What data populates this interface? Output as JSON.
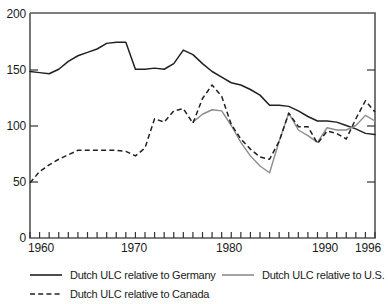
{
  "chart_data": {
    "type": "line",
    "title": "",
    "subtitle": "",
    "xlabel": "",
    "ylabel": "",
    "xlim": [
      1960,
      1996
    ],
    "ylim": [
      0,
      200
    ],
    "grid": false,
    "legend_position": "bottom",
    "y_ticks": [
      0,
      50,
      100,
      150,
      200
    ],
    "y_tick_labels": [
      "0",
      "50",
      "100",
      "150",
      "200"
    ],
    "x_ticks": [
      1960,
      1961,
      1962,
      1963,
      1964,
      1965,
      1966,
      1967,
      1968,
      1969,
      1970,
      1971,
      1972,
      1973,
      1974,
      1975,
      1976,
      1977,
      1978,
      1979,
      1980,
      1981,
      1982,
      1983,
      1984,
      1985,
      1986,
      1987,
      1988,
      1989,
      1990,
      1991,
      1992,
      1993,
      1994,
      1995,
      1996
    ],
    "x_tick_labels": [
      "1960",
      "1970",
      "1980",
      "1990",
      "1996"
    ],
    "x_labeled_ticks": [
      1960,
      1970,
      1980,
      1990,
      1996
    ],
    "series": [
      {
        "name": "Dutch ULC relative to Germany",
        "style": "solid",
        "color": "#231f20",
        "x": [
          1960,
          1961,
          1962,
          1963,
          1964,
          1965,
          1966,
          1967,
          1968,
          1969,
          1970,
          1971,
          1972,
          1973,
          1974,
          1975,
          1976,
          1977,
          1978,
          1979,
          1980,
          1981,
          1982,
          1983,
          1984,
          1985,
          1986,
          1987,
          1988,
          1989,
          1990,
          1991,
          1992,
          1993,
          1994,
          1995,
          1996
        ],
        "values": [
          148,
          147,
          146,
          150,
          157,
          162,
          165,
          168,
          173,
          174,
          174,
          150,
          150,
          151,
          150,
          155,
          167,
          163,
          155,
          148,
          143,
          138,
          136,
          132,
          127,
          118,
          118,
          117,
          113,
          108,
          104,
          104,
          103,
          100,
          97,
          93,
          92
        ]
      },
      {
        "name": "Dutch ULC relative to Canada",
        "style": "dashed",
        "color": "#231f20",
        "x": [
          1960,
          1961,
          1962,
          1963,
          1964,
          1965,
          1966,
          1967,
          1968,
          1969,
          1970,
          1971,
          1972,
          1973,
          1974,
          1975,
          1976,
          1977,
          1978,
          1979,
          1980,
          1981,
          1982,
          1983,
          1984,
          1985,
          1986,
          1987,
          1988,
          1989,
          1990,
          1991,
          1992,
          1993,
          1994,
          1995,
          1996
        ],
        "values": [
          49,
          59,
          65,
          70,
          74,
          78,
          78,
          78,
          78,
          78,
          77,
          73,
          80,
          106,
          103,
          113,
          115,
          102,
          124,
          136,
          126,
          101,
          88,
          79,
          72,
          70,
          86,
          111,
          99,
          99,
          84,
          95,
          93,
          88,
          106,
          122,
          112
        ]
      },
      {
        "name": "Dutch ULC relative to U.S.",
        "style": "solid",
        "color": "#8d8d8d",
        "x": [
          1977,
          1978,
          1979,
          1980,
          1981,
          1982,
          1983,
          1984,
          1985,
          1986,
          1987,
          1988,
          1989,
          1990,
          1991,
          1992,
          1993,
          1994,
          1995,
          1996
        ],
        "values": [
          103,
          110,
          114,
          113,
          100,
          85,
          73,
          64,
          58,
          86,
          111,
          96,
          91,
          85,
          98,
          96,
          96,
          100,
          109,
          104
        ]
      }
    ]
  },
  "legend": {
    "items": [
      {
        "label": "Dutch ULC relative to Germany",
        "style": "solid-dark"
      },
      {
        "label": "Dutch ULC relative to U.S.",
        "style": "solid-gray"
      },
      {
        "label": "Dutch ULC relative to Canada",
        "style": "dashed-dark"
      }
    ]
  }
}
